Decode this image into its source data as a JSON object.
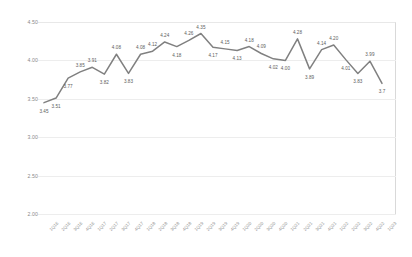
{
  "chart_data": {
    "type": "line",
    "title": "",
    "subtitle": "",
    "xlabel": "",
    "ylabel": "",
    "ylim": [
      2.0,
      4.5
    ],
    "yticks": [
      "2.00",
      "2.50",
      "3.00",
      "3.50",
      "4.00",
      "4.50"
    ],
    "ytick_values": [
      2.0,
      2.5,
      3.0,
      3.5,
      4.0,
      4.5
    ],
    "grid": true,
    "grid_axis": "y",
    "legend": "none",
    "markers": false,
    "data_labels": true,
    "line_color": "#808080",
    "categories": [
      "1Q16",
      "2Q16",
      "3Q16",
      "4Q16",
      "1Q17",
      "2Q17",
      "3Q17",
      "4Q17",
      "1Q18",
      "2Q18",
      "3Q18",
      "4Q18",
      "1Q19",
      "2Q19",
      "3Q19",
      "4Q19",
      "1Q20",
      "2Q20",
      "3Q20",
      "4Q20",
      "1Q21",
      "2Q21",
      "3Q21",
      "4Q21",
      "1Q22",
      "2Q22",
      "3Q22",
      "4Q22",
      "1Q23"
    ],
    "values": [
      3.45,
      3.51,
      3.77,
      3.85,
      3.91,
      3.82,
      4.08,
      3.83,
      4.08,
      4.12,
      4.24,
      4.18,
      4.26,
      4.35,
      4.17,
      4.15,
      4.13,
      4.18,
      4.09,
      4.02,
      4.0,
      4.28,
      3.89,
      4.14,
      4.2,
      4.01,
      3.83,
      3.99,
      3.7
    ],
    "value_labels": [
      "3.45",
      "3.51",
      "3.77",
      "3.85",
      "3.91",
      "3.82",
      "4.08",
      "3.83",
      "4.08",
      "4.12",
      "4.24",
      "4.18",
      "4.26",
      "4.35",
      "4.17",
      "4.15",
      "4.13",
      "4.18",
      "4.09",
      "4.02",
      "4.00",
      "4.28",
      "3.89",
      "4.14",
      "4.20",
      "4.01",
      "3.83",
      "3.99",
      "3.7"
    ],
    "label_positions": [
      "below",
      "below",
      "below",
      "above",
      "above",
      "below",
      "above",
      "below",
      "above",
      "above",
      "above",
      "below",
      "above",
      "above",
      "below",
      "above",
      "below",
      "above",
      "above",
      "below",
      "below",
      "above",
      "below",
      "above",
      "above",
      "below",
      "below",
      "above",
      "below"
    ]
  }
}
